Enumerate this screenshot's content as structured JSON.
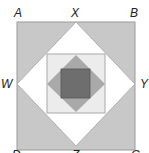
{
  "diagram": {
    "type": "nested-squares",
    "labels": {
      "A": "A",
      "X": "X",
      "B": "B",
      "W": "W",
      "Y": "Y",
      "D": "D",
      "Z": "Z",
      "C": "C"
    },
    "colors": {
      "outer_square": "#c8c8c8",
      "diamond": "#ffffff",
      "middle_square": "#ececec",
      "inner_diamond": "#a9a9a9",
      "center_square": "#6e6e6e",
      "stroke": "#9a9a9a"
    }
  }
}
